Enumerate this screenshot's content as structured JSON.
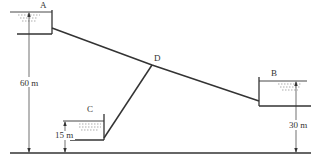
{
  "diagram": {
    "colors": {
      "line": "#333333",
      "water": "#555555",
      "background": "#ffffff"
    },
    "reservoirs": [
      {
        "id": "A",
        "label": "A",
        "elevation_label": "60 m"
      },
      {
        "id": "B",
        "label": "B",
        "elevation_label": "30 m"
      },
      {
        "id": "C",
        "label": "C",
        "elevation_label": "15 m"
      }
    ],
    "junction": {
      "label": "D"
    },
    "dimensions": {
      "a": "60 m",
      "b": "30 m",
      "c": "15 m"
    }
  }
}
